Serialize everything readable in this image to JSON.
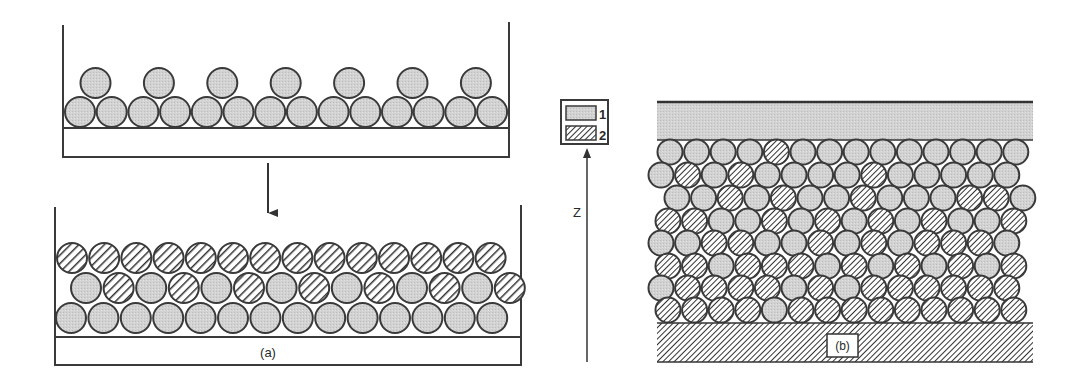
{
  "colors": {
    "background": "#ffffff",
    "stroke": "#3a3a3a",
    "particle_type_1_fill": "#d0d0d0",
    "particle_type_2_fill": "#ffffff",
    "hatch_line": "#333333",
    "plate_top_fill": "#d6d6d6"
  },
  "legend": {
    "items": [
      {
        "id": "1",
        "label": "1",
        "pattern": "light-gray"
      },
      {
        "id": "2",
        "label": "2",
        "pattern": "hatched"
      }
    ]
  },
  "axis": {
    "label": "Z",
    "direction": "up"
  },
  "panel_a": {
    "label": "(a)",
    "before": {
      "rows": [
        {
          "cy": 112,
          "x0": 80,
          "dx": 31.7,
          "r": 15,
          "types": "11111111111111"
        },
        {
          "cy": 83,
          "x0": 95.5,
          "dx": 63.4,
          "r": 15,
          "types": "1111111"
        }
      ]
    },
    "after": {
      "rows": [
        {
          "cy": 318,
          "x0": 71,
          "dx": 32.4,
          "r": 15,
          "types": "11111111111111"
        },
        {
          "cy": 288,
          "x0": 86,
          "dx": 32.6,
          "r": 15,
          "types": "12121212121212"
        },
        {
          "cy": 258,
          "x0": 72,
          "dx": 32.2,
          "r": 15,
          "types": "22222222222222"
        }
      ]
    }
  },
  "panel_b": {
    "label": "(b)",
    "rows": [
      {
        "cy": 152,
        "x0": 670,
        "dx": 26.6,
        "r": 12.5,
        "types": "11112111111111"
      },
      {
        "cy": 175,
        "x0": 661,
        "dx": 26.6,
        "r": 12.5,
        "types": "12121111211111"
      },
      {
        "cy": 198,
        "x0": 677,
        "dx": 26.6,
        "r": 12.5,
        "types": "11212112111221"
      },
      {
        "cy": 221,
        "x0": 668,
        "dx": 26.6,
        "r": 12.5,
        "types": "22112121212112"
      },
      {
        "cy": 243,
        "x0": 661,
        "dx": 26.6,
        "r": 12.5,
        "types": "11221121212221"
      },
      {
        "cy": 266,
        "x0": 668,
        "dx": 26.6,
        "r": 12.5,
        "types": "22122212121212"
      },
      {
        "cy": 288,
        "x0": 661,
        "dx": 26.6,
        "r": 12.5,
        "types": "12222121222222"
      },
      {
        "cy": 310,
        "x0": 668,
        "dx": 26.6,
        "r": 12.5,
        "types": "22221222222222"
      }
    ]
  }
}
